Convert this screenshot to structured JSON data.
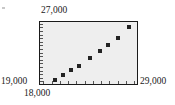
{
  "figure": {
    "name": "scatter-plot-figure",
    "background_color": "#ffffff",
    "plot_background_color": "#eeeeee",
    "frame_color": "#1a1a1a",
    "marker_color": "#232323"
  },
  "labels": {
    "y_max": "27,000",
    "y_min": "19,000",
    "x_min": "18,000",
    "x_max": "29,000"
  },
  "chart_data": {
    "type": "scatter",
    "title": "",
    "xlabel": "",
    "ylabel": "",
    "xlim": [
      18000,
      29000
    ],
    "ylim": [
      19000,
      27000
    ],
    "xticklabels": [
      "18,000",
      "29,000"
    ],
    "yticklabels": [
      "19,000",
      "27,000"
    ],
    "grid": false,
    "legend": null,
    "x_tick_count": 12,
    "y_tick_count": 17,
    "series": [
      {
        "name": "observations",
        "marker": "square",
        "x": [
          19650,
          20550,
          21500,
          22450,
          23650,
          24800,
          25700,
          26800,
          28000
        ],
        "y": [
          19550,
          20150,
          20850,
          21350,
          22300,
          23250,
          23950,
          24900,
          26200
        ]
      }
    ]
  },
  "points": [
    {
      "name": "data-point-1",
      "x_pct": 15.0,
      "y_pct": 93.0
    },
    {
      "name": "data-point-2",
      "x_pct": 23.2,
      "y_pct": 85.5
    },
    {
      "name": "data-point-3",
      "x_pct": 31.8,
      "y_pct": 77.0
    },
    {
      "name": "data-point-4",
      "x_pct": 40.4,
      "y_pct": 70.5
    },
    {
      "name": "data-point-5",
      "x_pct": 51.3,
      "y_pct": 58.5
    },
    {
      "name": "data-point-6",
      "x_pct": 61.7,
      "y_pct": 46.5
    },
    {
      "name": "data-point-7",
      "x_pct": 69.9,
      "y_pct": 37.5
    },
    {
      "name": "data-point-8",
      "x_pct": 79.9,
      "y_pct": 25.5
    },
    {
      "name": "data-point-9",
      "x_pct": 91.5,
      "y_pct": 8.5
    }
  ],
  "x_ticks_pct": [
    3.5,
    12.0,
    20.5,
    29.0,
    37.5,
    46.0,
    54.5,
    63.0,
    71.5,
    80.0,
    88.5,
    97.0
  ],
  "y_ticks_pct": [
    3.0,
    8.8,
    14.6,
    20.4,
    26.2,
    32.0,
    37.8,
    43.6,
    49.4,
    55.2,
    61.0,
    66.8,
    72.6,
    78.4,
    84.2,
    90.0,
    95.8
  ]
}
